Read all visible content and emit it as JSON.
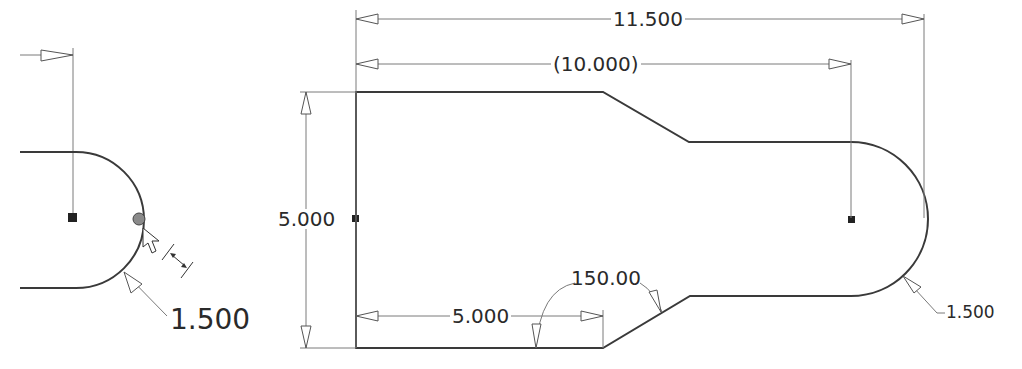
{
  "detail_view": {
    "radius_label": "1.500",
    "cursor": "pointer-with-dimension-glyph"
  },
  "main_view": {
    "dimensions": {
      "overall_length": "11.500",
      "center_distance": "(10.000)",
      "height": "5.000",
      "bottom_length": "5.000",
      "chamfer_angle": "150.00",
      "end_radius": "1.500"
    }
  },
  "colors": {
    "geometry": "#3a3a3a",
    "dimension": "#7a7a7a",
    "background": "#ffffff"
  }
}
